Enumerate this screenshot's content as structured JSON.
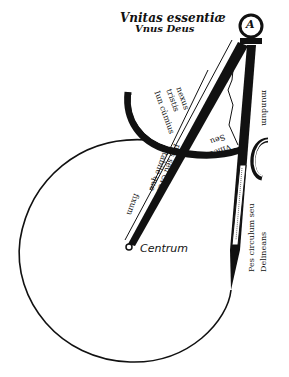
{
  "title": {
    "line1": "Vnitas essentiæ",
    "line2": "Vnus Deus"
  },
  "compass": {
    "head_letter": "A",
    "arc_labels": {
      "outer": "Iun cùmius",
      "middle": "tristis",
      "inner": "nexus"
    },
    "vinculum_labels": [
      "Vincu",
      "Seu"
    ],
    "right_leg_upper": "mundum",
    "fixed_leg_label": [
      "Pes seu Crus",
      "stabile que",
      "fixum"
    ],
    "moving_leg_label": [
      "Pes circulum seu",
      "Delineans"
    ]
  },
  "circle": {
    "center_label": "Centrum"
  },
  "colors": {
    "ink": "#111111",
    "paper": "#ffffff"
  }
}
